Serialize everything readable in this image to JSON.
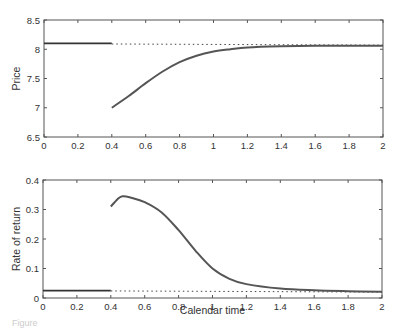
{
  "chart_data": [
    {
      "type": "line",
      "title": "",
      "xlabel": "",
      "ylabel": "Price",
      "xlim": [
        0,
        2
      ],
      "ylim": [
        6.5,
        8.5
      ],
      "xticks": [
        "0",
        "0.2",
        "0.4",
        "0.6",
        "0.8",
        "1",
        "1.2",
        "1.4",
        "1.6",
        "1.8",
        "2"
      ],
      "yticks": [
        "6.5",
        "7",
        "7.5",
        "8",
        "8.5"
      ],
      "grid": false,
      "series": [
        {
          "name": "Price before shock",
          "style": "solid",
          "x": [
            0,
            0.4
          ],
          "y": [
            8.1,
            8.1
          ]
        },
        {
          "name": "Steady-state price",
          "style": "dotted",
          "x": [
            0.4,
            2.0
          ],
          "y": [
            8.09,
            8.07
          ]
        },
        {
          "name": "Price path after shock",
          "style": "solid",
          "x": [
            0.4,
            0.5,
            0.6,
            0.7,
            0.8,
            0.9,
            1.0,
            1.1,
            1.2,
            1.4,
            1.6,
            1.8,
            2.0
          ],
          "y": [
            7.0,
            7.2,
            7.42,
            7.62,
            7.78,
            7.89,
            7.96,
            8.0,
            8.03,
            8.05,
            8.06,
            8.06,
            8.06
          ]
        }
      ]
    },
    {
      "type": "line",
      "title": "",
      "xlabel": "Calendar time",
      "ylabel": "Rate of return",
      "xlim": [
        0,
        2
      ],
      "ylim": [
        0,
        0.4
      ],
      "xticks": [
        "0",
        "0.2",
        "0.4",
        "0.6",
        "0.8",
        "1",
        "1.2",
        "1.4",
        "1.6",
        "1.8",
        "2"
      ],
      "yticks": [
        "0",
        "0.1",
        "0.2",
        "0.3",
        "0.4"
      ],
      "grid": false,
      "series": [
        {
          "name": "Return before shock",
          "style": "solid",
          "x": [
            0,
            0.4
          ],
          "y": [
            0.025,
            0.025
          ]
        },
        {
          "name": "Steady-state return",
          "style": "dotted",
          "x": [
            0.4,
            2.0
          ],
          "y": [
            0.024,
            0.02
          ]
        },
        {
          "name": "Return path after shock",
          "style": "solid",
          "x": [
            0.4,
            0.44,
            0.47,
            0.52,
            0.6,
            0.7,
            0.8,
            0.9,
            1.0,
            1.1,
            1.2,
            1.4,
            1.6,
            1.8,
            2.0
          ],
          "y": [
            0.31,
            0.335,
            0.345,
            0.34,
            0.325,
            0.29,
            0.23,
            0.16,
            0.1,
            0.065,
            0.047,
            0.032,
            0.026,
            0.023,
            0.021
          ]
        }
      ]
    }
  ],
  "figure_caption": "Figure"
}
